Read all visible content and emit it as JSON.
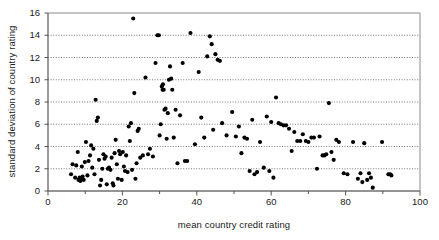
{
  "chart_data": {
    "type": "scatter",
    "title": "",
    "xlabel": "mean country credit rating",
    "ylabel": "standard deviation of country rating",
    "xlim": [
      0,
      100
    ],
    "ylim": [
      0,
      16
    ],
    "xticks": [
      0,
      20,
      40,
      60,
      80,
      100
    ],
    "yticks": [
      0,
      2,
      4,
      6,
      8,
      10,
      12,
      14,
      16
    ],
    "grid": "horizontal-dotted",
    "legend": "none",
    "marker": {
      "shape": "circle",
      "color": "#000000",
      "size": 3.2
    },
    "points": [
      [
        6.2,
        1.5
      ],
      [
        6.6,
        2.4
      ],
      [
        7.3,
        1.2
      ],
      [
        7.6,
        2.3
      ],
      [
        8.0,
        3.5
      ],
      [
        8.2,
        1.0
      ],
      [
        8.5,
        1.2
      ],
      [
        8.7,
        0.9
      ],
      [
        8.9,
        1.1
      ],
      [
        9.1,
        2.2
      ],
      [
        9.3,
        1.3
      ],
      [
        9.6,
        1.0
      ],
      [
        9.9,
        2.6
      ],
      [
        10.2,
        4.4
      ],
      [
        10.6,
        1.4
      ],
      [
        10.9,
        2.7
      ],
      [
        11.3,
        3.2
      ],
      [
        11.6,
        4.1
      ],
      [
        11.9,
        2.1
      ],
      [
        12.2,
        3.8
      ],
      [
        12.5,
        1.5
      ],
      [
        12.8,
        8.2
      ],
      [
        13.1,
        6.3
      ],
      [
        13.4,
        6.6
      ],
      [
        13.7,
        2.8
      ],
      [
        14.0,
        0.5
      ],
      [
        14.3,
        1.0
      ],
      [
        14.6,
        2.0
      ],
      [
        14.9,
        3.3
      ],
      [
        15.2,
        2.9
      ],
      [
        15.5,
        3.1
      ],
      [
        15.8,
        0.6
      ],
      [
        16.1,
        2.0
      ],
      [
        16.4,
        2.1
      ],
      [
        16.8,
        1.9
      ],
      [
        17.1,
        3.0
      ],
      [
        17.4,
        0.7
      ],
      [
        17.6,
        0.5
      ],
      [
        17.9,
        3.4
      ],
      [
        18.2,
        4.6
      ],
      [
        18.5,
        2.4
      ],
      [
        18.8,
        1.1
      ],
      [
        19.1,
        3.6
      ],
      [
        19.4,
        3.3
      ],
      [
        19.8,
        1.0
      ],
      [
        20.1,
        3.5
      ],
      [
        20.4,
        2.2
      ],
      [
        20.7,
        1.8
      ],
      [
        21.0,
        3.2
      ],
      [
        21.4,
        1.7
      ],
      [
        21.7,
        5.8
      ],
      [
        22.0,
        4.5
      ],
      [
        22.3,
        6.1
      ],
      [
        22.6,
        1.9
      ],
      [
        22.9,
        15.5
      ],
      [
        23.2,
        8.8
      ],
      [
        23.5,
        1.1
      ],
      [
        23.8,
        2.5
      ],
      [
        24.1,
        5.4
      ],
      [
        24.4,
        5.6
      ],
      [
        24.8,
        3.0
      ],
      [
        25.5,
        3.2
      ],
      [
        26.2,
        10.2
      ],
      [
        26.9,
        3.3
      ],
      [
        27.4,
        3.8
      ],
      [
        28.2,
        3.1
      ],
      [
        28.9,
        11.5
      ],
      [
        29.4,
        14.0
      ],
      [
        29.8,
        14.0
      ],
      [
        30.0,
        5.0
      ],
      [
        30.3,
        6.0
      ],
      [
        30.6,
        9.4
      ],
      [
        30.8,
        9.1
      ],
      [
        30.9,
        9.6
      ],
      [
        31.1,
        9.1
      ],
      [
        31.3,
        7.3
      ],
      [
        31.6,
        7.4
      ],
      [
        31.9,
        4.7
      ],
      [
        32.2,
        7.0
      ],
      [
        32.5,
        10.0
      ],
      [
        32.8,
        11.2
      ],
      [
        33.1,
        10.1
      ],
      [
        33.4,
        9.1
      ],
      [
        33.8,
        4.8
      ],
      [
        34.3,
        7.3
      ],
      [
        34.8,
        2.5
      ],
      [
        35.5,
        6.8
      ],
      [
        36.2,
        11.5
      ],
      [
        36.8,
        2.7
      ],
      [
        37.4,
        2.7
      ],
      [
        38.3,
        14.2
      ],
      [
        39.5,
        4.2
      ],
      [
        40.5,
        10.7
      ],
      [
        41.2,
        6.6
      ],
      [
        42.0,
        4.8
      ],
      [
        42.8,
        12.1
      ],
      [
        43.5,
        13.9
      ],
      [
        44.0,
        13.2
      ],
      [
        44.4,
        5.5
      ],
      [
        45.0,
        12.3
      ],
      [
        45.6,
        11.8
      ],
      [
        46.2,
        11.7
      ],
      [
        46.8,
        6.1
      ],
      [
        48.0,
        5.0
      ],
      [
        49.5,
        7.1
      ],
      [
        50.5,
        4.9
      ],
      [
        51.3,
        5.8
      ],
      [
        52.0,
        3.4
      ],
      [
        52.8,
        4.8
      ],
      [
        53.5,
        4.7
      ],
      [
        54.2,
        1.8
      ],
      [
        54.9,
        6.4
      ],
      [
        55.5,
        1.5
      ],
      [
        56.2,
        1.7
      ],
      [
        57.0,
        4.4
      ],
      [
        58.0,
        2.1
      ],
      [
        58.8,
        6.7
      ],
      [
        59.5,
        1.8
      ],
      [
        60.0,
        6.2
      ],
      [
        60.6,
        1.2
      ],
      [
        61.3,
        8.4
      ],
      [
        62.0,
        6.1
      ],
      [
        62.6,
        6.0
      ],
      [
        63.3,
        5.9
      ],
      [
        64.0,
        5.9
      ],
      [
        64.8,
        5.6
      ],
      [
        65.5,
        3.6
      ],
      [
        66.2,
        5.3
      ],
      [
        67.0,
        4.5
      ],
      [
        67.8,
        4.5
      ],
      [
        68.5,
        5.1
      ],
      [
        69.3,
        4.5
      ],
      [
        70.0,
        4.4
      ],
      [
        70.8,
        4.8
      ],
      [
        71.5,
        4.8
      ],
      [
        72.3,
        2.0
      ],
      [
        73.0,
        4.9
      ],
      [
        73.8,
        3.2
      ],
      [
        74.3,
        3.2
      ],
      [
        74.8,
        3.3
      ],
      [
        75.5,
        7.9
      ],
      [
        76.2,
        3.5
      ],
      [
        76.8,
        2.8
      ],
      [
        77.5,
        4.6
      ],
      [
        78.2,
        4.4
      ],
      [
        79.5,
        1.6
      ],
      [
        80.5,
        1.5
      ],
      [
        82.0,
        4.4
      ],
      [
        83.3,
        1.1
      ],
      [
        84.0,
        1.6
      ],
      [
        84.5,
        0.8
      ],
      [
        85.0,
        4.3
      ],
      [
        85.8,
        1.0
      ],
      [
        86.3,
        1.6
      ],
      [
        86.8,
        1.2
      ],
      [
        87.3,
        0.3
      ],
      [
        89.8,
        4.4
      ],
      [
        91.5,
        1.5
      ],
      [
        92.0,
        1.5
      ],
      [
        92.3,
        1.4
      ]
    ]
  },
  "axes": {
    "x_tick_labels": [
      "0",
      "20",
      "40",
      "60",
      "80",
      "100"
    ],
    "y_tick_labels": [
      "0",
      "2",
      "4",
      "6",
      "8",
      "10",
      "12",
      "14",
      "16"
    ]
  }
}
